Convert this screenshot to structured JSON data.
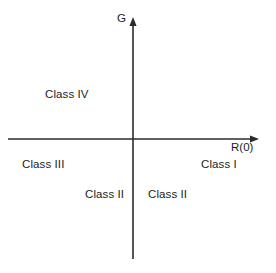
{
  "diagram": {
    "background_color": "#ffffff",
    "line_color": "#2b2b2b",
    "text_color": "#1c1c1c",
    "axes": {
      "y_axis_label": "G",
      "x_axis_label": "R(0)",
      "origin": {
        "x": 133,
        "y": 139
      },
      "x_axis_start": {
        "x": 8,
        "y": 139
      },
      "x_axis_end": {
        "x": 259,
        "y": 139
      },
      "y_axis_top": {
        "x": 133,
        "y": 19
      },
      "y_axis_bottom": {
        "x": 133,
        "y": 259
      },
      "x_axis_has_arrow": true,
      "y_axis_has_arrow": true
    },
    "regions": [
      {
        "id": "class-iv",
        "label": "Class IV",
        "quadrant": "upper-left",
        "x": 45,
        "y": 89
      },
      {
        "id": "class-iii",
        "label": "Class III",
        "quadrant": "lower-left",
        "x": 22,
        "y": 159
      },
      {
        "id": "class-i",
        "label": "Class I",
        "quadrant": "lower-right",
        "x": 201,
        "y": 159
      },
      {
        "id": "class-ii-left",
        "label": "Class II",
        "quadrant": "lower-left",
        "x": 85,
        "y": 189
      },
      {
        "id": "class-ii-right",
        "label": "Class II",
        "quadrant": "lower-right",
        "x": 148,
        "y": 189
      }
    ]
  }
}
